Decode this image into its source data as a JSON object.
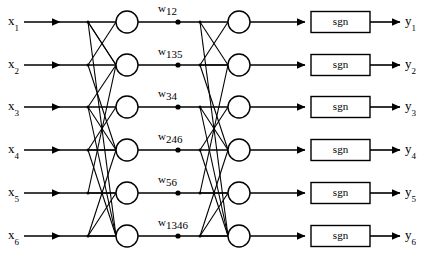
{
  "figure": {
    "type": "neural-network-diagram",
    "rows": 6,
    "width": 426,
    "height": 256,
    "stroke_color": "#000000",
    "background_color": "#ffffff"
  },
  "inputs": [
    {
      "label": "x",
      "sub": "1"
    },
    {
      "label": "x",
      "sub": "2"
    },
    {
      "label": "x",
      "sub": "3"
    },
    {
      "label": "x",
      "sub": "4"
    },
    {
      "label": "x",
      "sub": "5"
    },
    {
      "label": "x",
      "sub": "6"
    }
  ],
  "outputs": [
    {
      "label": "y",
      "sub": "1"
    },
    {
      "label": "y",
      "sub": "2"
    },
    {
      "label": "y",
      "sub": "3"
    },
    {
      "label": "y",
      "sub": "4"
    },
    {
      "label": "y",
      "sub": "5"
    },
    {
      "label": "y",
      "sub": "6"
    }
  ],
  "weights": [
    {
      "symbol": "w",
      "sub": "12"
    },
    {
      "symbol": "w",
      "sub": "135"
    },
    {
      "symbol": "w",
      "sub": "34"
    },
    {
      "symbol": "w",
      "sub": "246"
    },
    {
      "symbol": "w",
      "sub": "56"
    },
    {
      "symbol": "w",
      "sub": "1346"
    }
  ],
  "activation_blocks": [
    {
      "label": "sgn"
    },
    {
      "label": "sgn"
    },
    {
      "label": "sgn"
    },
    {
      "label": "sgn"
    },
    {
      "label": "sgn"
    },
    {
      "label": "sgn"
    }
  ],
  "layers": {
    "hidden_1": {
      "node_count": 6,
      "shape": "circle"
    },
    "hidden_2": {
      "node_count": 6,
      "shape": "circle"
    }
  },
  "geometry": {
    "row_y": [
      22,
      65,
      107,
      150,
      193,
      236
    ],
    "input_label_x": 8,
    "input_arrow_x1": 24,
    "input_arrow_x2": 60,
    "branch1_x": 88,
    "node1_cx": 127,
    "node1_r": 11,
    "weight_dot_x": 178,
    "branch2_x": 200,
    "node2_cx": 239,
    "node2_r": 11,
    "arrow2_x1": 255,
    "arrow2_x2": 305,
    "sgn_box_x": 311,
    "sgn_box_w": 59,
    "sgn_box_h": 21,
    "out_arrow_x1": 372,
    "out_arrow_x2": 400,
    "output_label_x": 405
  },
  "edges": {
    "layer1_connections": [
      [
        0,
        1
      ],
      [
        1,
        0
      ],
      [
        2,
        3
      ],
      [
        3,
        2
      ],
      [
        0,
        5
      ],
      [
        2,
        5
      ],
      [
        3,
        5
      ],
      [
        5,
        5
      ],
      [
        0,
        1
      ],
      [
        4,
        1
      ],
      [
        2,
        1
      ],
      [
        1,
        3
      ],
      [
        3,
        3
      ],
      [
        5,
        3
      ],
      [
        4,
        4
      ],
      [
        5,
        4
      ]
    ],
    "layer2_connections": [
      [
        0,
        1
      ],
      [
        1,
        0
      ],
      [
        2,
        3
      ],
      [
        3,
        2
      ],
      [
        0,
        5
      ],
      [
        2,
        5
      ],
      [
        3,
        5
      ],
      [
        5,
        5
      ],
      [
        1,
        1
      ],
      [
        4,
        1
      ],
      [
        1,
        3
      ],
      [
        5,
        3
      ],
      [
        4,
        4
      ],
      [
        5,
        4
      ]
    ]
  }
}
